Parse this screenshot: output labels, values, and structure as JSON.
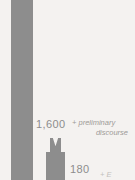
{
  "figure": {
    "background_color": "#f4f2f0",
    "bar_color": "#8d8d8d",
    "label_color": "#8d8d8d",
    "annotation_color": "#9d9a97"
  },
  "labels": {
    "tall_bar_value": "",
    "value_1600": "1,600",
    "value_180": "180"
  },
  "annotations": {
    "preliminary_line_1": "+ preliminary",
    "preliminary_line_2": "discourse",
    "clipped_bottom_right": "+ E"
  },
  "chart_data": {
    "type": "bar",
    "title": "",
    "xlabel": "",
    "ylabel": "",
    "categories": [
      "(clipped left bar)",
      "1,600",
      "180"
    ],
    "values": [
      null,
      1600,
      180
    ],
    "value_labels": [
      "",
      "1,600",
      "180"
    ],
    "annotations": [
      {
        "attached_to": "1,600",
        "text": "+ preliminary discourse"
      },
      {
        "attached_to": "180",
        "text": "+ E"
      }
    ],
    "grid": false,
    "legend": "none"
  }
}
